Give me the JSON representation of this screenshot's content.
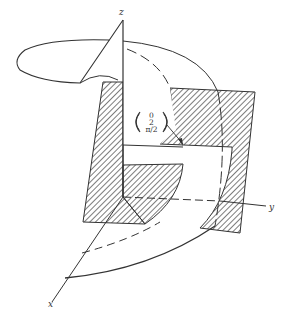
{
  "figure": {
    "axes": {
      "x_label": "x",
      "y_label": "y",
      "z_label": "z"
    },
    "vector_label": {
      "row1": "0",
      "row2": "2",
      "row3": "π/2"
    },
    "colors": {
      "stroke": "#333333",
      "hatch": "#444444",
      "background": "#ffffff"
    }
  }
}
